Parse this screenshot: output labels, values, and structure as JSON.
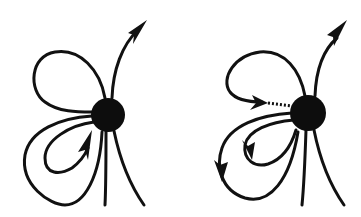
{
  "figure": {
    "colors": {
      "ink": "#111111",
      "background": "#ffffff"
    },
    "panels": [
      {
        "id": "left",
        "ball": {
          "cx": 108,
          "cy": 115,
          "r": 17
        },
        "features": [
          "upper loop",
          "lower double loop with inward arrow",
          "upward outgoing arrow",
          "two downward tails"
        ]
      },
      {
        "id": "right",
        "ball": {
          "cx": 308,
          "cy": 113,
          "r": 18
        },
        "features": [
          "upper loop ending in arrow pointing at ball",
          "dotted gap segment",
          "lower loops with downward arrows",
          "upward outgoing arrow",
          "two downward tails"
        ]
      }
    ]
  }
}
